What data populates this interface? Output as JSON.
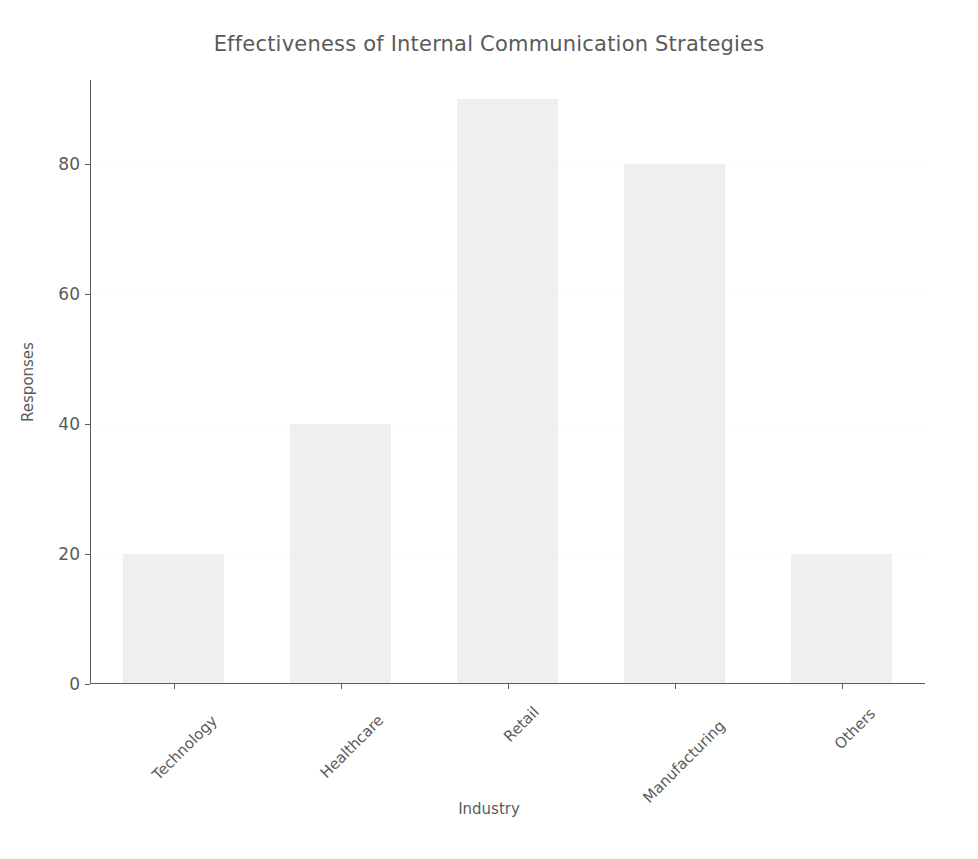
{
  "chart_data": {
    "type": "bar",
    "title": "Effectiveness of Internal Communication Strategies",
    "xlabel": "Industry",
    "ylabel": "Responses",
    "categories": [
      "Technology",
      "Healthcare",
      "Retail",
      "Manufacturing",
      "Others"
    ],
    "values": [
      20,
      40,
      90,
      80,
      20
    ],
    "series": [
      {
        "name": "Responses",
        "values": [
          20,
          40,
          90,
          80,
          20
        ]
      }
    ],
    "ylim": [
      0,
      93
    ],
    "y_ticks": [
      0,
      20,
      40,
      60,
      80
    ],
    "y_tick_labels": [
      "0",
      "20",
      "40",
      "60",
      "80"
    ],
    "xlim_categories": 5,
    "grid": true,
    "legend": false,
    "bar_color": "#efefef",
    "axis_color": "#5d5d5d",
    "text_color": "#5a5a5a",
    "grid_color": "#fafafa",
    "background_color": "#ffffff",
    "xtick_rotation": -45
  }
}
